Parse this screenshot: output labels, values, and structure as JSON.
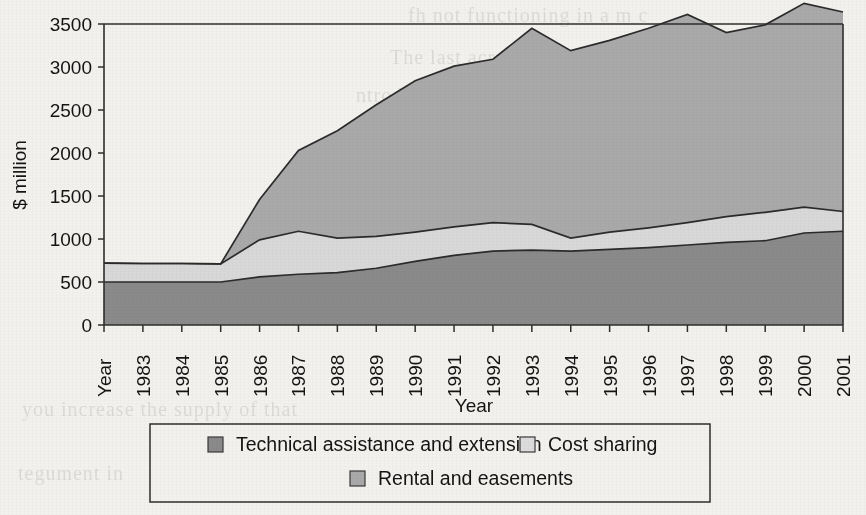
{
  "chart_data": {
    "type": "area",
    "stacked": true,
    "title": "",
    "xlabel": "Year",
    "ylabel": "$ million",
    "ylim": [
      0,
      3500
    ],
    "ytick_step": 500,
    "ytick_labels": [
      "0",
      "500",
      "1000",
      "1500",
      "2000",
      "2500",
      "3000",
      "3500"
    ],
    "grid": false,
    "legend_position": "bottom",
    "categories": [
      "Year",
      "1983",
      "1984",
      "1985",
      "1986",
      "1987",
      "1988",
      "1989",
      "1990",
      "1991",
      "1992",
      "1993",
      "1994",
      "1995",
      "1996",
      "1997",
      "1998",
      "1999",
      "2000",
      "2001"
    ],
    "series": [
      {
        "name": "Technical assistance and extension",
        "color": "#8a8a8a",
        "values": [
          500,
          500,
          500,
          500,
          560,
          590,
          610,
          660,
          740,
          810,
          860,
          870,
          860,
          880,
          900,
          930,
          960,
          980,
          1070,
          1090
        ]
      },
      {
        "name": "Cost sharing",
        "color": "#d8d8d8",
        "values": [
          220,
          215,
          215,
          210,
          430,
          500,
          400,
          370,
          340,
          330,
          330,
          300,
          150,
          200,
          230,
          260,
          300,
          330,
          300,
          230
        ]
      },
      {
        "name": "Rental and easements",
        "color": "#a9a9a9",
        "values": [
          0,
          0,
          0,
          0,
          470,
          940,
          1250,
          1530,
          1760,
          1870,
          1900,
          2280,
          2180,
          2230,
          2320,
          2420,
          2140,
          2180,
          2370,
          2320
        ]
      }
    ],
    "stack_totals": [
      720,
      715,
      715,
      710,
      1460,
      2030,
      2260,
      2560,
      2840,
      3010,
      3090,
      3450,
      3190,
      3310,
      3450,
      3610,
      3400,
      3490,
      3740,
      3640
    ],
    "cumulative": {
      "technical": [
        500,
        500,
        500,
        500,
        560,
        590,
        610,
        660,
        740,
        810,
        860,
        870,
        860,
        880,
        900,
        930,
        960,
        980,
        1070,
        1090
      ],
      "plus_cost_sharing": [
        720,
        715,
        715,
        710,
        990,
        1090,
        1010,
        1030,
        1080,
        1140,
        1190,
        1170,
        1010,
        1080,
        1130,
        1190,
        1260,
        1310,
        1370,
        1320
      ],
      "plus_rental": [
        720,
        715,
        715,
        710,
        1460,
        2030,
        2260,
        2560,
        2840,
        3010,
        3090,
        3450,
        3190,
        3310,
        3450,
        3610,
        3400,
        3490,
        3740,
        3640
      ]
    }
  },
  "legend": {
    "entries": [
      {
        "label": "Technical assistance and extension",
        "swatch": "#8a8a8a"
      },
      {
        "label": "Cost sharing",
        "swatch": "#dcdcdc"
      },
      {
        "label": "Rental and easements",
        "swatch": "#a9a9a9"
      }
    ]
  },
  "axes": {
    "y_title": "$ million",
    "x_title": "Year"
  },
  "bleed_text": [
    "fh not functioning in a m c",
    "The last acre of 1985 program",
    "ntroduced, and co ca e",
    "at million in 1987 to $1.0 b",
    "ture (USDA 2001)",
    "n of soil erosion on",
    "the CRP as",
    "you increase the supply of that",
    "tegument in"
  ]
}
